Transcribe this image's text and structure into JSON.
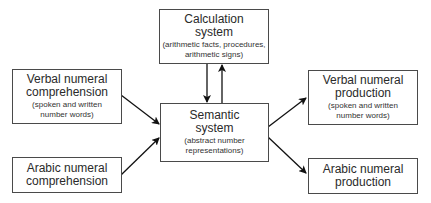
{
  "diagram": {
    "nodes": [
      {
        "id": "calculation",
        "title": [
          "Calculation",
          "system"
        ],
        "subtitle": [
          "(arithmetic facts, procedures,",
          "arithmetic signs)"
        ]
      },
      {
        "id": "verbal_comprehension",
        "title": [
          "Verbal numeral",
          "comprehension"
        ],
        "subtitle": [
          "(spoken and written",
          "number words)"
        ]
      },
      {
        "id": "arabic_comprehension",
        "title": [
          "Arabic numeral",
          "comprehension"
        ],
        "subtitle": []
      },
      {
        "id": "semantic",
        "title": [
          "Semantic",
          "system"
        ],
        "subtitle": [
          "(abstract number",
          "representations)"
        ]
      },
      {
        "id": "verbal_production",
        "title": [
          "Verbal numeral",
          "production"
        ],
        "subtitle": [
          "(spoken and written",
          "number words)"
        ]
      },
      {
        "id": "arabic_production",
        "title": [
          "Arabic numeral",
          "production"
        ],
        "subtitle": []
      }
    ],
    "edges": [
      {
        "from": "verbal_comprehension",
        "to": "semantic"
      },
      {
        "from": "arabic_comprehension",
        "to": "semantic"
      },
      {
        "from": "calculation",
        "to": "semantic"
      },
      {
        "from": "semantic",
        "to": "calculation"
      },
      {
        "from": "semantic",
        "to": "verbal_production"
      },
      {
        "from": "semantic",
        "to": "arabic_production"
      }
    ]
  }
}
